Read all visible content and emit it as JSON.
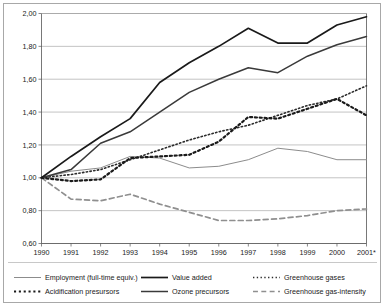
{
  "chart_data": {
    "type": "line",
    "title": "",
    "subtitle": "",
    "xlabel": "",
    "ylabel": "",
    "x": [
      "1990",
      "1991",
      "1992",
      "1993",
      "1994",
      "1995",
      "1996",
      "1997",
      "1998",
      "1999",
      "2000",
      "2001*"
    ],
    "xtick_labels": [
      "1990",
      "1991",
      "1992",
      "1993",
      "1994",
      "1995",
      "1996",
      "1997",
      "1998",
      "1999",
      "2000",
      "2001*"
    ],
    "ytick_labels": [
      "0,60",
      "0,80",
      "1,00",
      "1,20",
      "1,40",
      "1,60",
      "1,80",
      "2,00"
    ],
    "ytick_values": [
      0.6,
      0.8,
      1.0,
      1.2,
      1.4,
      1.6,
      1.8,
      2.0
    ],
    "ylim": [
      0.6,
      2.0
    ],
    "grid": true,
    "legend_position": "bottom",
    "series": [
      {
        "name": "Employment (full-time equiv.)",
        "color": "#8c8c8c",
        "style": "solid",
        "width": 1.0,
        "values": [
          1.0,
          1.04,
          1.06,
          1.13,
          1.12,
          1.06,
          1.07,
          1.11,
          1.18,
          1.16,
          1.11,
          1.11
        ]
      },
      {
        "name": "Value added",
        "color": "#1a1a1a",
        "style": "solid",
        "width": 1.7,
        "values": [
          1.0,
          1.13,
          1.25,
          1.36,
          1.58,
          1.7,
          1.8,
          1.91,
          1.82,
          1.82,
          1.93,
          1.98
        ]
      },
      {
        "name": "Greenhouse gases",
        "color": "#2b2b2b",
        "style": "dotted-fine",
        "width": 1.6,
        "values": [
          1.0,
          1.02,
          1.05,
          1.11,
          1.17,
          1.23,
          1.28,
          1.32,
          1.38,
          1.44,
          1.48,
          1.56
        ]
      },
      {
        "name": "Acidification presursors",
        "color": "#1a1a1a",
        "style": "dotted-bold",
        "width": 2.2,
        "values": [
          1.0,
          0.98,
          0.99,
          1.12,
          1.13,
          1.14,
          1.22,
          1.37,
          1.36,
          1.42,
          1.48,
          1.38
        ]
      },
      {
        "name": "Ozone precursors",
        "color": "#3a3a3a",
        "style": "solid",
        "width": 1.5,
        "values": [
          1.0,
          1.05,
          1.21,
          1.28,
          1.4,
          1.52,
          1.6,
          1.67,
          1.64,
          1.74,
          1.81,
          1.86
        ]
      },
      {
        "name": "Greenhouse gas-intensity",
        "color": "#8f8f8f",
        "style": "dashed",
        "width": 1.7,
        "values": [
          1.0,
          0.87,
          0.86,
          0.9,
          0.84,
          0.79,
          0.74,
          0.74,
          0.75,
          0.77,
          0.8,
          0.81
        ]
      }
    ]
  },
  "legend": {
    "rows": [
      [
        {
          "label": "Employment (full-time equiv.)",
          "series": 0
        },
        {
          "label": "Value added",
          "series": 1
        },
        {
          "label": "Greenhouse gases",
          "series": 2
        }
      ],
      [
        {
          "label": "Acidification presursors",
          "series": 3
        },
        {
          "label": "Ozone precursors",
          "series": 4
        },
        {
          "label": "Greenhouse gas-intensity",
          "series": 5
        }
      ]
    ]
  }
}
